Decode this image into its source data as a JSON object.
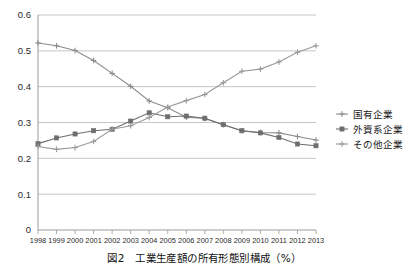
{
  "caption": "図2　工業生産額の所有形態別構成（%）",
  "chart_data": {
    "type": "line",
    "title": "",
    "xlabel": "",
    "ylabel": "",
    "grid": true,
    "legend_position": "right",
    "xlim": [
      1998,
      2013
    ],
    "ylim": [
      0,
      0.6
    ],
    "ytick_labels": [
      "0",
      "0.1",
      "0.2",
      "0.3",
      "0.4",
      "0.5",
      "0.6"
    ],
    "ytick_values": [
      0,
      0.1,
      0.2,
      0.3,
      0.4,
      0.5,
      0.6
    ],
    "categories": [
      "1998",
      "1999",
      "2000",
      "2001",
      "2002",
      "2003",
      "2004",
      "2005",
      "2006",
      "2007",
      "2008",
      "2009",
      "2010",
      "2011",
      "2012",
      "2013"
    ],
    "series": [
      {
        "name": "国有企業",
        "marker": "plus",
        "color": "#8c8c8c",
        "values": [
          0.522,
          0.514,
          0.501,
          0.473,
          0.437,
          0.401,
          0.36,
          0.341,
          0.315,
          0.311,
          0.294,
          0.277,
          0.272,
          0.271,
          0.261,
          0.251
        ]
      },
      {
        "name": "外資系企業",
        "marker": "square",
        "color": "#6e6e6e",
        "values": [
          0.241,
          0.257,
          0.268,
          0.277,
          0.281,
          0.304,
          0.327,
          0.316,
          0.318,
          0.312,
          0.294,
          0.277,
          0.271,
          0.258,
          0.24,
          0.235
        ]
      },
      {
        "name": "その他企業",
        "marker": "plus",
        "color": "#9a9a9a",
        "values": [
          0.233,
          0.225,
          0.23,
          0.247,
          0.281,
          0.291,
          0.314,
          0.343,
          0.361,
          0.378,
          0.411,
          0.443,
          0.449,
          0.469,
          0.496,
          0.514
        ]
      }
    ]
  },
  "legend": {
    "items": [
      {
        "label": "国有企業"
      },
      {
        "label": "外資系企業"
      },
      {
        "label": "その他企業"
      }
    ]
  }
}
